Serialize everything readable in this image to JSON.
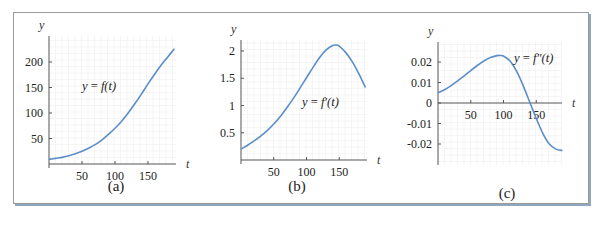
{
  "colors": {
    "curve": "#5b8ec9",
    "axis": "#555555",
    "grid": "#eeeeee",
    "frame": "#9a9a9a",
    "shadow": "#8fa6bf"
  },
  "chart_data": [
    {
      "type": "line",
      "panel": "(a)",
      "title": "",
      "curve_label": "y = f(t)",
      "xlabel": "t",
      "ylabel": "y",
      "xticks": [
        50,
        100,
        150
      ],
      "yticks": [
        50,
        100,
        150,
        200
      ],
      "ytick_labels": [
        "50",
        "100",
        "150",
        "200"
      ],
      "xlim": [
        0,
        190
      ],
      "ylim": [
        0,
        245
      ],
      "grid": true,
      "x": [
        0,
        10,
        20,
        30,
        40,
        50,
        60,
        70,
        80,
        90,
        100,
        110,
        120,
        130,
        140,
        150,
        160,
        170,
        180,
        190
      ],
      "values": [
        9,
        11,
        13,
        16,
        20,
        25,
        31,
        38,
        47,
        58,
        70,
        84,
        100,
        118,
        137,
        157,
        176,
        194,
        210,
        226
      ],
      "layout": {
        "x0": 49,
        "y0": 164,
        "xscale": 0.66,
        "yscale": 0.51,
        "ytop": 36,
        "xright": 176,
        "lbl": [
          82,
          90
        ],
        "cap": [
          116,
          191
        ]
      }
    },
    {
      "type": "line",
      "panel": "(b)",
      "title": "",
      "curve_label": "y = f′(t)",
      "xlabel": "t",
      "ylabel": "y",
      "xticks": [
        50,
        100,
        150
      ],
      "yticks": [
        0.5,
        1,
        1.5,
        2
      ],
      "ytick_labels": [
        "0.5",
        "1",
        "1.5",
        "2"
      ],
      "xlim": [
        0,
        190
      ],
      "ylim": [
        0,
        2.3
      ],
      "grid": true,
      "x": [
        0,
        10,
        20,
        30,
        40,
        50,
        60,
        70,
        80,
        90,
        100,
        110,
        120,
        130,
        140,
        145,
        150,
        160,
        170,
        180,
        190
      ],
      "values": [
        0.2,
        0.27,
        0.35,
        0.44,
        0.54,
        0.66,
        0.8,
        0.96,
        1.13,
        1.32,
        1.51,
        1.7,
        1.88,
        2.02,
        2.1,
        2.11,
        2.09,
        1.97,
        1.8,
        1.58,
        1.33
      ],
      "layout": {
        "x0": 241,
        "y0": 160,
        "xscale": 0.655,
        "yscale": 54.5,
        "ytop": 40,
        "xright": 367,
        "lbl": [
          302,
          106
        ],
        "cap": [
          297,
          191
        ]
      }
    },
    {
      "type": "line",
      "panel": "(c)",
      "title": "",
      "curve_label": "y = f″(t)",
      "xlabel": "t",
      "ylabel": "y",
      "xticks": [
        50,
        100,
        150
      ],
      "yticks": [
        -0.02,
        -0.01,
        0,
        0.01,
        0.02
      ],
      "ytick_labels": [
        "-0.02",
        "-0.01",
        "0",
        "0.01",
        "0.02"
      ],
      "xlim": [
        0,
        190
      ],
      "ylim": [
        -0.03,
        0.03
      ],
      "grid": true,
      "x": [
        0,
        10,
        20,
        30,
        40,
        50,
        60,
        70,
        80,
        90,
        95,
        100,
        110,
        120,
        130,
        140,
        150,
        160,
        170,
        180,
        190
      ],
      "values": [
        0.005,
        0.0065,
        0.0085,
        0.0108,
        0.0132,
        0.0158,
        0.0183,
        0.0205,
        0.0222,
        0.0231,
        0.0232,
        0.0229,
        0.0205,
        0.0155,
        0.0085,
        0.0005,
        -0.0075,
        -0.0148,
        -0.02,
        -0.0225,
        -0.0232
      ],
      "layout": {
        "x0": 438,
        "y0": 103,
        "xscale": 0.655,
        "yscale": 2050,
        "ytop": 42,
        "ybottom": 165,
        "xright": 562,
        "lbl": [
          514,
          62
        ],
        "cap": [
          507,
          198
        ]
      }
    }
  ],
  "captions": [
    "(a)",
    "(b)",
    "(c)"
  ],
  "axis_labels": {
    "x": "t",
    "y": "y"
  }
}
